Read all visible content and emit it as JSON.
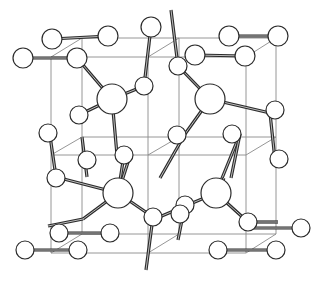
{
  "diagram": {
    "title": "",
    "type": "crystal-structure-unit-cell",
    "colors": {
      "frame": "#8a8a8a",
      "bond": "#2b2b2b",
      "atom_fill": "#ffffff",
      "atom_stroke": "#2b2b2b"
    },
    "frame_lines": [
      [
        82,
        38,
        276,
        38
      ],
      [
        51,
        57,
        246,
        57
      ],
      [
        82,
        38,
        51,
        57
      ],
      [
        276,
        38,
        246,
        57
      ],
      [
        82,
        234,
        276,
        234
      ],
      [
        51,
        253,
        246,
        253
      ],
      [
        82,
        234,
        51,
        253
      ],
      [
        276,
        234,
        246,
        253
      ],
      [
        82,
        38,
        82,
        234
      ],
      [
        276,
        38,
        276,
        234
      ],
      [
        51,
        57,
        51,
        253
      ],
      [
        246,
        57,
        246,
        253
      ],
      [
        82,
        137,
        276,
        137
      ],
      [
        51,
        155,
        246,
        155
      ],
      [
        82,
        137,
        51,
        155
      ],
      [
        276,
        137,
        246,
        155
      ],
      [
        179,
        38,
        148,
        57
      ],
      [
        179,
        234,
        148,
        253
      ],
      [
        179,
        38,
        179,
        234
      ],
      [
        148,
        57,
        148,
        253
      ],
      [
        179,
        137,
        148,
        155
      ]
    ],
    "bonds": [
      [
        52,
        39,
        108,
        36
      ],
      [
        23,
        58,
        77,
        58
      ],
      [
        229,
        36,
        278,
        36
      ],
      [
        195,
        55,
        245,
        56
      ],
      [
        77,
        58,
        112,
        99
      ],
      [
        151,
        27,
        144,
        86
      ],
      [
        171,
        10,
        178,
        66
      ],
      [
        144,
        86,
        112,
        99
      ],
      [
        178,
        66,
        210,
        99
      ],
      [
        210,
        99,
        270,
        113
      ],
      [
        112,
        99,
        117,
        155
      ],
      [
        112,
        99,
        79,
        115
      ],
      [
        210,
        99,
        185,
        134
      ],
      [
        275,
        110,
        270,
        113
      ],
      [
        270,
        113,
        275,
        160
      ],
      [
        185,
        134,
        160,
        178
      ],
      [
        240,
        134,
        216,
        193
      ],
      [
        118,
        193,
        56,
        177
      ],
      [
        118,
        193,
        130,
        156
      ],
      [
        118,
        193,
        124,
        155
      ],
      [
        118,
        193,
        153,
        217
      ],
      [
        118,
        193,
        83,
        219
      ],
      [
        216,
        193,
        157,
        218
      ],
      [
        216,
        193,
        248,
        222
      ],
      [
        216,
        193,
        224,
        178
      ],
      [
        153,
        217,
        146,
        270
      ],
      [
        185,
        205,
        178,
        240
      ],
      [
        248,
        222,
        278,
        222
      ],
      [
        83,
        219,
        48,
        226
      ],
      [
        59,
        233,
        111,
        233
      ],
      [
        25,
        250,
        78,
        250
      ],
      [
        218,
        250,
        276,
        250
      ],
      [
        250,
        228,
        301,
        228
      ],
      [
        56,
        177,
        49,
        129
      ],
      [
        87,
        177,
        82,
        137
      ],
      [
        240,
        134,
        231,
        178
      ]
    ],
    "atoms": [
      {
        "x": 52,
        "y": 39,
        "r": 10,
        "kind": "small"
      },
      {
        "x": 108,
        "y": 36,
        "r": 10,
        "kind": "small"
      },
      {
        "x": 23,
        "y": 58,
        "r": 10,
        "kind": "small"
      },
      {
        "x": 77,
        "y": 58,
        "r": 10,
        "kind": "small"
      },
      {
        "x": 151,
        "y": 27,
        "r": 10,
        "kind": "small"
      },
      {
        "x": 178,
        "y": 66,
        "r": 9,
        "kind": "small"
      },
      {
        "x": 144,
        "y": 86,
        "r": 9,
        "kind": "small"
      },
      {
        "x": 229,
        "y": 36,
        "r": 10,
        "kind": "small"
      },
      {
        "x": 278,
        "y": 36,
        "r": 10,
        "kind": "small"
      },
      {
        "x": 195,
        "y": 55,
        "r": 10,
        "kind": "small"
      },
      {
        "x": 245,
        "y": 56,
        "r": 10,
        "kind": "small"
      },
      {
        "x": 112,
        "y": 99,
        "r": 15,
        "kind": "large"
      },
      {
        "x": 210,
        "y": 99,
        "r": 15,
        "kind": "large"
      },
      {
        "x": 79,
        "y": 115,
        "r": 9,
        "kind": "small"
      },
      {
        "x": 275,
        "y": 110,
        "r": 9,
        "kind": "small"
      },
      {
        "x": 48,
        "y": 133,
        "r": 9,
        "kind": "small"
      },
      {
        "x": 87,
        "y": 160,
        "r": 9,
        "kind": "small"
      },
      {
        "x": 124,
        "y": 155,
        "r": 9,
        "kind": "small"
      },
      {
        "x": 177,
        "y": 135,
        "r": 9,
        "kind": "small"
      },
      {
        "x": 232,
        "y": 134,
        "r": 9,
        "kind": "small"
      },
      {
        "x": 279,
        "y": 159,
        "r": 9,
        "kind": "small"
      },
      {
        "x": 56,
        "y": 178,
        "r": 9,
        "kind": "small"
      },
      {
        "x": 118,
        "y": 193,
        "r": 15,
        "kind": "large"
      },
      {
        "x": 216,
        "y": 193,
        "r": 15,
        "kind": "large"
      },
      {
        "x": 185,
        "y": 205,
        "r": 9,
        "kind": "small"
      },
      {
        "x": 153,
        "y": 217,
        "r": 9,
        "kind": "small"
      },
      {
        "x": 248,
        "y": 222,
        "r": 9,
        "kind": "small"
      },
      {
        "x": 110,
        "y": 233,
        "r": 9,
        "kind": "small"
      },
      {
        "x": 59,
        "y": 233,
        "r": 9,
        "kind": "small"
      },
      {
        "x": 25,
        "y": 250,
        "r": 9,
        "kind": "small"
      },
      {
        "x": 78,
        "y": 250,
        "r": 9,
        "kind": "small"
      },
      {
        "x": 218,
        "y": 250,
        "r": 9,
        "kind": "small"
      },
      {
        "x": 276,
        "y": 250,
        "r": 9,
        "kind": "small"
      },
      {
        "x": 301,
        "y": 228,
        "r": 9,
        "kind": "small"
      },
      {
        "x": 180,
        "y": 214,
        "r": 9,
        "kind": "small"
      },
      {
        "x": 176,
        "y": 253,
        "r": 0,
        "kind": "none"
      }
    ],
    "dangling_bonds": [
      [
        171,
        10,
        178,
        66
      ],
      [
        153,
        217,
        146,
        270
      ]
    ]
  }
}
